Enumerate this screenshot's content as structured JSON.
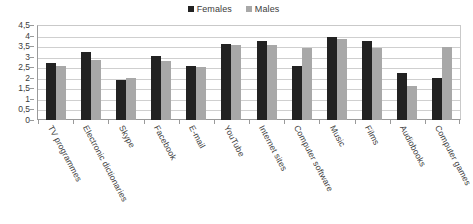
{
  "chart_data": {
    "type": "bar",
    "title": "",
    "xlabel": "",
    "ylabel": "",
    "ylim": [
      0,
      4.5
    ],
    "grid": true,
    "legend_position": "top-center",
    "decimal_separator": ",",
    "categories": [
      "TV programmes",
      "Electronic dictionaries",
      "Skype",
      "Facebook",
      "E-mail",
      "YouTube",
      "Internet sites",
      "Computer software",
      "Music",
      "Films",
      "Audiobooks",
      "Computer games"
    ],
    "ytick_labels": [
      "0",
      "0,5",
      "1",
      "1,5",
      "2",
      "2,5",
      "3",
      "3,5",
      "4",
      "4,5"
    ],
    "ytick_values": [
      0,
      0.5,
      1,
      1.5,
      2,
      2.5,
      3,
      3.5,
      4,
      4.5
    ],
    "series": [
      {
        "name": "Females",
        "color": "#222222",
        "values": [
          2.68,
          3.22,
          1.88,
          3.02,
          2.54,
          3.6,
          3.75,
          2.57,
          3.92,
          3.72,
          2.24,
          1.97
        ]
      },
      {
        "name": "Males",
        "color": "#a8a8a8",
        "values": [
          2.58,
          2.82,
          1.98,
          2.8,
          2.52,
          3.54,
          3.57,
          3.42,
          3.82,
          3.43,
          1.63,
          3.48
        ]
      }
    ]
  },
  "legend": {
    "entries": [
      {
        "label": "Females",
        "color": "#222222"
      },
      {
        "label": "Males",
        "color": "#a8a8a8"
      }
    ]
  }
}
